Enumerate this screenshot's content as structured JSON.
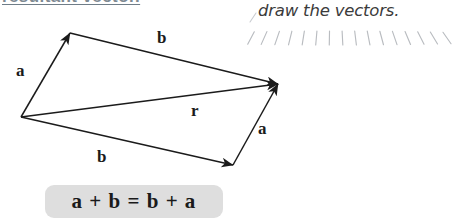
{
  "page": {
    "width": 453,
    "height": 221,
    "background_color": "#ffffff",
    "ink_color": "#1b1b1b"
  },
  "clipped_heading": {
    "text": "resultant vector.",
    "color": "#7e8a93",
    "note": "partially cropped at top edge, underlined"
  },
  "handwritten_note": {
    "text": "draw the vectors.",
    "comma_mark": ",",
    "color": "#3b3b3b"
  },
  "tick_scale": {
    "count": 16,
    "color": "#b9bcc0",
    "angles_deg": [
      -28,
      -24,
      -19,
      -14,
      -9,
      -5,
      -1,
      3,
      7,
      11,
      15,
      19,
      23,
      27,
      31,
      35
    ]
  },
  "figure": {
    "name": "vector-addition-parallelogram",
    "stroke_color": "#1b1b1b",
    "origin": {
      "x": 21,
      "y": 117
    },
    "top_vertex": {
      "x": 70,
      "y": 33
    },
    "right_vertex": {
      "x": 278,
      "y": 84
    },
    "bottom_vertex": {
      "x": 233,
      "y": 165
    },
    "arrows": [
      {
        "name": "vector-a-left",
        "label": "a",
        "from": [
          21,
          117
        ],
        "to": [
          70,
          33
        ]
      },
      {
        "name": "vector-b-top",
        "label": "b",
        "from": [
          70,
          33
        ],
        "to": [
          278,
          84
        ]
      },
      {
        "name": "vector-r",
        "label": "r",
        "from": [
          21,
          117
        ],
        "to": [
          278,
          84
        ]
      },
      {
        "name": "vector-b-bottom",
        "label": "b",
        "from": [
          21,
          117
        ],
        "to": [
          233,
          165
        ]
      },
      {
        "name": "vector-a-right",
        "label": "a",
        "from": [
          233,
          165
        ],
        "to": [
          278,
          84
        ]
      }
    ],
    "labels": {
      "a_left": "a",
      "b_top": "b",
      "r": "r",
      "b_bottom": "b",
      "a_right": "a"
    }
  },
  "equation": {
    "text": "a + b = b + a",
    "chip_color": "#dedede",
    "text_color": "#1a1a1a"
  }
}
